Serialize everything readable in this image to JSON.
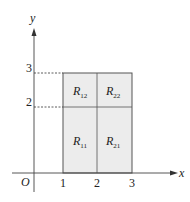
{
  "diagram": {
    "axes": {
      "x_label": "x",
      "y_label": "y",
      "origin_label": "O",
      "x_ticks": [
        "1",
        "2",
        "3"
      ],
      "y_ticks": [
        "2",
        "3"
      ]
    },
    "region": {
      "x_range": [
        1,
        3
      ],
      "y_range": [
        0,
        3
      ],
      "fill_color": "#ececec",
      "border_color": "#555555",
      "subrectangles": [
        {
          "label": "R",
          "sub": "11",
          "x_range": [
            1,
            2
          ],
          "y_range": [
            0,
            2
          ]
        },
        {
          "label": "R",
          "sub": "21",
          "x_range": [
            2,
            3
          ],
          "y_range": [
            0,
            2
          ]
        },
        {
          "label": "R",
          "sub": "12",
          "x_range": [
            1,
            2
          ],
          "y_range": [
            2,
            3
          ]
        },
        {
          "label": "R",
          "sub": "22",
          "x_range": [
            2,
            3
          ],
          "y_range": [
            2,
            3
          ]
        }
      ]
    },
    "dashed_guides": [
      {
        "from": [
          0,
          3
        ],
        "to": [
          1,
          3
        ]
      },
      {
        "from": [
          0,
          2
        ],
        "to": [
          1,
          2
        ]
      }
    ]
  }
}
